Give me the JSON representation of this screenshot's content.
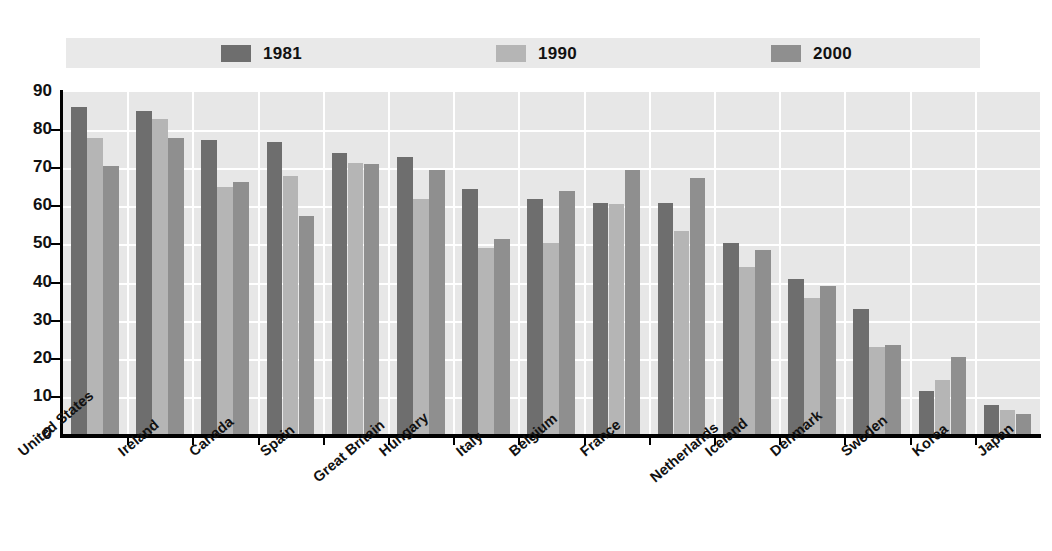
{
  "chart_data": {
    "type": "bar",
    "title": "",
    "subtitle": "",
    "xlabel": "",
    "ylabel": "",
    "ylim": [
      0,
      90
    ],
    "ytick_step": 10,
    "yticks": [
      "0",
      "10",
      "20",
      "30",
      "40",
      "50",
      "60",
      "70",
      "80",
      "90"
    ],
    "grid": true,
    "legend_position": "top",
    "categories": [
      "United States",
      "Ireland",
      "Canada",
      "Spain",
      "Great Britain",
      "Hungary",
      "Italy",
      "Belgium",
      "France",
      "Netherlands",
      "Iceland",
      "Denmark",
      "Sweden",
      "Korea",
      "Japan"
    ],
    "series": [
      {
        "name": "1981",
        "color": "#6e6e6e",
        "values": [
          86,
          85,
          77.5,
          77,
          74,
          73,
          64.5,
          62,
          61,
          61,
          50.5,
          41,
          33,
          11.5,
          8
        ]
      },
      {
        "name": "1990",
        "color": "#b5b5b5",
        "values": [
          78,
          83,
          65,
          68,
          71.5,
          62,
          49,
          50.5,
          60.5,
          53.5,
          44,
          36,
          23,
          14.5,
          6.5
        ]
      },
      {
        "name": "2000",
        "color": "#8f8f8f",
        "values": [
          70.5,
          78,
          66.5,
          57.5,
          71,
          69.5,
          51.5,
          64,
          69.5,
          67.5,
          48.5,
          39,
          23.5,
          20.5,
          5.5
        ]
      }
    ]
  },
  "legend": {
    "items": [
      {
        "label": "1981",
        "color": "#6e6e6e"
      },
      {
        "label": "1990",
        "color": "#b5b5b5"
      },
      {
        "label": "2000",
        "color": "#8f8f8f"
      }
    ]
  },
  "colors": {
    "plot_background": "#e7e7e7",
    "legend_background": "#e9e9e9",
    "gridline": "#ffffff",
    "axis": "#000000",
    "text": "#111111"
  }
}
